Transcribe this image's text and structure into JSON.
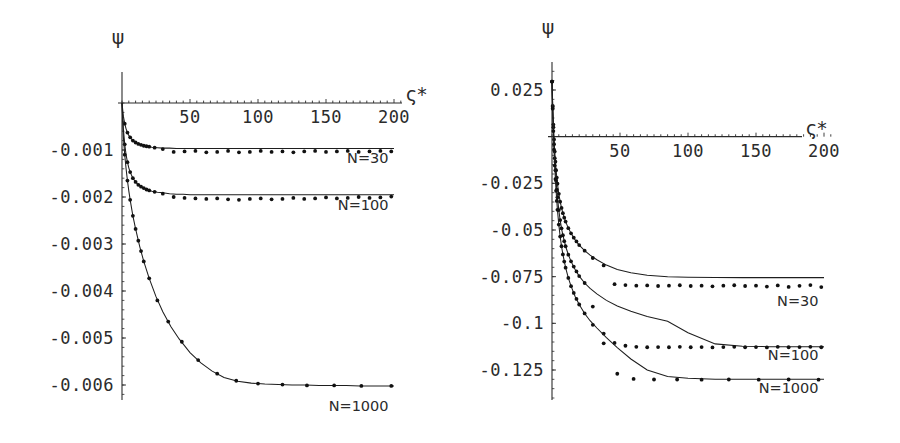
{
  "figure": {
    "background": "#ffffff",
    "ink_color": "#2b2b2b",
    "panels": [
      "left",
      "right"
    ]
  },
  "chart_data": [
    {
      "id": "left",
      "type": "line",
      "title": "",
      "subtitle": "",
      "xlabel": "ς*",
      "ylabel": "ψ",
      "xlim": [
        0,
        210
      ],
      "ylim": [
        -0.0063,
        0.0003
      ],
      "xticks": [
        50,
        100,
        150,
        200
      ],
      "xticklabels": [
        "50",
        "100",
        "150",
        "200"
      ],
      "yticks": [
        -0.001,
        -0.002,
        -0.003,
        -0.004,
        -0.005,
        -0.006
      ],
      "yticklabels": [
        "-0.001",
        "-0.002",
        "-0.003",
        "-0.004",
        "-0.005",
        "-0.006"
      ],
      "grid": false,
      "legend_position": "inline-right-of-curve",
      "axis_origin_crossing": [
        0,
        0
      ],
      "series": [
        {
          "name": "N=30",
          "label": "N=30",
          "label_xy": [
            196,
            -0.00128
          ],
          "marker": "dot",
          "plateau": -0.00097,
          "x": [
            0,
            1,
            2,
            3,
            4,
            5,
            6,
            8,
            10,
            12,
            15,
            18,
            22,
            26,
            30,
            35,
            40,
            45,
            50,
            57,
            64,
            71,
            78,
            85,
            92,
            100,
            108,
            116,
            124,
            132,
            140,
            148,
            156,
            164,
            172,
            180,
            188,
            196,
            200
          ],
          "y": [
            0.0,
            -0.00028,
            -0.00044,
            -0.00055,
            -0.00063,
            -0.00069,
            -0.00073,
            -0.0008,
            -0.00084,
            -0.00087,
            -0.0009,
            -0.00092,
            -0.00094,
            -0.00095,
            -0.00096,
            -0.00096,
            -0.00097,
            -0.00097,
            -0.00097,
            -0.00097,
            -0.00097,
            -0.00097,
            -0.00097,
            -0.00097,
            -0.00097,
            -0.00097,
            -0.00097,
            -0.00097,
            -0.00097,
            -0.00097,
            -0.00097,
            -0.00097,
            -0.00097,
            -0.00097,
            -0.00097,
            -0.00097,
            -0.00097,
            -0.00097,
            -0.00097
          ],
          "marker_x": [
            2,
            4,
            6,
            8,
            10,
            12,
            14,
            16,
            18,
            20,
            24,
            30,
            38,
            46,
            54,
            62,
            70,
            78,
            86,
            94,
            102,
            110,
            118,
            126,
            134,
            142,
            150,
            158,
            166,
            174,
            182,
            190,
            198
          ],
          "marker_y": [
            -0.00044,
            -0.00063,
            -0.00073,
            -0.0008,
            -0.00084,
            -0.00087,
            -0.00089,
            -0.00091,
            -0.00092,
            -0.00093,
            -0.00095,
            -0.00098,
            -0.00104,
            -0.00103,
            -0.00102,
            -0.00105,
            -0.00104,
            -0.00102,
            -0.00105,
            -0.00104,
            -0.00102,
            -0.00104,
            -0.00103,
            -0.00105,
            -0.00103,
            -0.00102,
            -0.00104,
            -0.00103,
            -0.00102,
            -0.00104,
            -0.00103,
            -0.00102,
            -0.00103
          ]
        },
        {
          "name": "N=100",
          "label": "N=100",
          "label_xy": [
            196,
            -0.00228
          ],
          "marker": "dot",
          "plateau": -0.00195,
          "x": [
            0,
            1,
            2,
            3,
            4,
            5,
            6,
            8,
            10,
            12,
            15,
            18,
            22,
            26,
            30,
            35,
            40,
            45,
            50,
            57,
            64,
            71,
            78,
            85,
            92,
            100,
            110,
            120,
            130,
            140,
            150,
            160,
            170,
            180,
            190,
            200
          ],
          "y": [
            0.0,
            -0.00055,
            -0.00088,
            -0.0011,
            -0.00126,
            -0.00138,
            -0.00147,
            -0.0016,
            -0.00168,
            -0.00174,
            -0.0018,
            -0.00184,
            -0.00188,
            -0.0019,
            -0.00191,
            -0.00193,
            -0.00194,
            -0.00194,
            -0.00195,
            -0.00195,
            -0.00195,
            -0.00195,
            -0.00195,
            -0.00195,
            -0.00195,
            -0.00195,
            -0.00195,
            -0.00195,
            -0.00195,
            -0.00195,
            -0.00195,
            -0.00195,
            -0.00195,
            -0.00195,
            -0.00195,
            -0.00195
          ],
          "marker_x": [
            2,
            4,
            6,
            8,
            10,
            12,
            14,
            16,
            18,
            20,
            24,
            30,
            38,
            46,
            54,
            62,
            70,
            78,
            86,
            94,
            102,
            110,
            118,
            126,
            134,
            142,
            150,
            158,
            166,
            174,
            182,
            190,
            198
          ],
          "marker_y": [
            -0.00088,
            -0.00126,
            -0.00147,
            -0.0016,
            -0.00168,
            -0.00174,
            -0.00178,
            -0.00181,
            -0.00184,
            -0.00186,
            -0.00189,
            -0.00193,
            -0.002,
            -0.00202,
            -0.00203,
            -0.00204,
            -0.00203,
            -0.00205,
            -0.00206,
            -0.00204,
            -0.00203,
            -0.00205,
            -0.00204,
            -0.00202,
            -0.00204,
            -0.00203,
            -0.00201,
            -0.00203,
            -0.00202,
            -0.002,
            -0.00202,
            -0.00201,
            -0.00199
          ]
        },
        {
          "name": "N=1000",
          "label": "N=1000",
          "label_xy": [
            196,
            -0.00655
          ],
          "marker": "dot",
          "plateau": -0.00602,
          "x": [
            0,
            1,
            2,
            3,
            4,
            5,
            6,
            8,
            10,
            13,
            16,
            20,
            25,
            30,
            36,
            42,
            50,
            58,
            66,
            75,
            85,
            95,
            105,
            115,
            125,
            135,
            145,
            155,
            165,
            175,
            185,
            195,
            200
          ],
          "y": [
            0.0,
            -0.00072,
            -0.0011,
            -0.0014,
            -0.00165,
            -0.00187,
            -0.00206,
            -0.0024,
            -0.00268,
            -0.00305,
            -0.00337,
            -0.00373,
            -0.00412,
            -0.00444,
            -0.00476,
            -0.00502,
            -0.00531,
            -0.00553,
            -0.0057,
            -0.00584,
            -0.00592,
            -0.00596,
            -0.00598,
            -0.00599,
            -0.006,
            -0.006,
            -0.00601,
            -0.00601,
            -0.00601,
            -0.00602,
            -0.00602,
            -0.00602,
            -0.00602
          ],
          "marker_x": [
            2,
            4,
            6,
            8,
            10,
            12,
            14,
            16,
            20,
            26,
            34,
            44,
            56,
            70,
            84,
            100,
            118,
            136,
            156,
            176,
            198
          ],
          "marker_y": [
            -0.0011,
            -0.00165,
            -0.00206,
            -0.0024,
            -0.00268,
            -0.00293,
            -0.00315,
            -0.00337,
            -0.00373,
            -0.0042,
            -0.00465,
            -0.00508,
            -0.00547,
            -0.00576,
            -0.00591,
            -0.00597,
            -0.00599,
            -0.00601,
            -0.00601,
            -0.00602,
            -0.00602
          ]
        }
      ]
    },
    {
      "id": "right",
      "type": "line",
      "title": "",
      "subtitle": "",
      "xlabel": "ς*",
      "ylabel": "ψ",
      "xlim": [
        0,
        210
      ],
      "ylim": [
        -0.138,
        0.031
      ],
      "xticks": [
        50,
        100,
        150,
        200
      ],
      "xticklabels": [
        "50",
        "100",
        "150",
        "200"
      ],
      "yticks": [
        0.025,
        -0.025,
        -0.05,
        -0.075,
        -0.1,
        -0.125
      ],
      "yticklabels": [
        "0.025",
        "-0.025",
        "-0.05",
        "-0.075",
        "-0.1",
        "-0.125"
      ],
      "grid": false,
      "legend_position": "inline-right-of-curve",
      "axis_origin_crossing": [
        0,
        0
      ],
      "series": [
        {
          "name": "N=30",
          "label": "N=30",
          "label_xy": [
            196,
            -0.0905
          ],
          "marker": "dot",
          "plateau": -0.0755,
          "x": [
            0,
            0.5,
            1,
            1.5,
            2,
            2.5,
            3,
            4,
            5,
            6,
            7,
            8,
            10,
            12,
            14,
            17,
            20,
            24,
            28,
            33,
            40,
            48,
            58,
            70,
            85,
            100,
            120,
            140,
            160,
            180,
            200
          ],
          "y": [
            0.0295,
            0.0165,
            0.0065,
            -0.0015,
            -0.008,
            -0.0134,
            -0.018,
            -0.0252,
            -0.0306,
            -0.0348,
            -0.0382,
            -0.041,
            -0.0455,
            -0.049,
            -0.0518,
            -0.0553,
            -0.0581,
            -0.0611,
            -0.0635,
            -0.0659,
            -0.0688,
            -0.0711,
            -0.0729,
            -0.0742,
            -0.075,
            -0.0753,
            -0.0755,
            -0.0755,
            -0.0755,
            -0.0755,
            -0.0755
          ],
          "marker_x": [
            0,
            0.5,
            1,
            1.5,
            2,
            2.5,
            3,
            3.5,
            4,
            5,
            6,
            7,
            8,
            9,
            10,
            12,
            14,
            16,
            18,
            20,
            24,
            30,
            38,
            46,
            54,
            62,
            70,
            78,
            86,
            94,
            102,
            110,
            118,
            126,
            134,
            142,
            150,
            158,
            166,
            174,
            182,
            190,
            198
          ],
          "marker_y": [
            0.0295,
            0.0165,
            0.0065,
            -0.0015,
            -0.008,
            -0.0134,
            -0.018,
            -0.0219,
            -0.0252,
            -0.0306,
            -0.0348,
            -0.0382,
            -0.041,
            -0.0434,
            -0.0455,
            -0.049,
            -0.0518,
            -0.0541,
            -0.0561,
            -0.0581,
            -0.0611,
            -0.065,
            -0.069,
            -0.079,
            -0.0795,
            -0.0798,
            -0.0797,
            -0.08,
            -0.0798,
            -0.0796,
            -0.08,
            -0.0798,
            -0.0802,
            -0.0798,
            -0.0796,
            -0.08,
            -0.0798,
            -0.0803,
            -0.0797,
            -0.0805,
            -0.0799,
            -0.0795,
            -0.0806
          ]
        },
        {
          "name": "N=100",
          "label": "N=100",
          "label_xy": [
            196,
            -0.1195
          ],
          "marker": "dot",
          "plateau": -0.1125,
          "x": [
            0,
            0.5,
            1,
            1.5,
            2,
            2.5,
            3,
            4,
            5,
            6,
            7,
            8,
            10,
            12,
            14,
            17,
            20,
            24,
            28,
            33,
            40,
            48,
            58,
            70,
            85,
            100,
            120,
            140,
            160,
            180,
            200
          ],
          "y": [
            0.0295,
            0.016,
            0.005,
            -0.004,
            -0.0115,
            -0.018,
            -0.0236,
            -0.0325,
            -0.0393,
            -0.0447,
            -0.0491,
            -0.0528,
            -0.0587,
            -0.0632,
            -0.0668,
            -0.0712,
            -0.0747,
            -0.0784,
            -0.0813,
            -0.0842,
            -0.0877,
            -0.0907,
            -0.0935,
            -0.0963,
            -0.0989,
            -0.105,
            -0.111,
            -0.1123,
            -0.1125,
            -0.1125,
            -0.1125
          ],
          "marker_x": [
            0,
            0.5,
            1,
            1.5,
            2,
            2.5,
            3,
            3.5,
            4,
            5,
            6,
            7,
            8,
            9,
            10,
            12,
            14,
            16,
            18,
            20,
            24,
            30,
            38,
            46,
            54,
            62,
            70,
            78,
            86,
            94,
            102,
            110,
            118,
            126,
            134,
            142,
            150,
            158,
            166,
            174,
            182,
            190,
            198
          ],
          "marker_y": [
            0.0295,
            0.016,
            0.005,
            -0.004,
            -0.0115,
            -0.018,
            -0.0236,
            -0.0284,
            -0.0325,
            -0.0393,
            -0.0447,
            -0.0491,
            -0.0528,
            -0.056,
            -0.0587,
            -0.0632,
            -0.0668,
            -0.0696,
            -0.0722,
            -0.0747,
            -0.0784,
            -0.091,
            -0.1055,
            -0.1105,
            -0.112,
            -0.1126,
            -0.1128,
            -0.1127,
            -0.1128,
            -0.1126,
            -0.1128,
            -0.1127,
            -0.1129,
            -0.1127,
            -0.1126,
            -0.1128,
            -0.1127,
            -0.1129,
            -0.1126,
            -0.1128,
            -0.1127,
            -0.1126,
            -0.1128
          ]
        },
        {
          "name": "N=1000",
          "label": "N=1000",
          "label_xy": [
            196,
            -0.1375
          ],
          "marker": "dot",
          "plateau": -0.13,
          "x": [
            0,
            0.5,
            1,
            1.5,
            2,
            2.5,
            3,
            4,
            5,
            6,
            7,
            8,
            10,
            12,
            14,
            17,
            20,
            24,
            28,
            33,
            40,
            48,
            58,
            70,
            85,
            100,
            120,
            140,
            160,
            180,
            200
          ],
          "y": [
            0.0295,
            0.015,
            0.003,
            -0.007,
            -0.0155,
            -0.0227,
            -0.029,
            -0.0392,
            -0.0471,
            -0.0535,
            -0.0587,
            -0.0631,
            -0.0702,
            -0.0757,
            -0.0801,
            -0.0856,
            -0.0899,
            -0.0947,
            -0.0986,
            -0.1025,
            -0.1077,
            -0.113,
            -0.1191,
            -0.125,
            -0.1285,
            -0.1294,
            -0.1299,
            -0.13,
            -0.13,
            -0.13,
            -0.13
          ],
          "marker_x": [
            0,
            0.5,
            1,
            1.5,
            2,
            2.5,
            3,
            3.5,
            4,
            5,
            6,
            7,
            8,
            9,
            10,
            12,
            14,
            16,
            18,
            20,
            24,
            30,
            38,
            48,
            60,
            75,
            92,
            110,
            130,
            152,
            174,
            196
          ],
          "marker_y": [
            0.0295,
            0.015,
            0.003,
            -0.007,
            -0.0155,
            -0.0227,
            -0.029,
            -0.0344,
            -0.0392,
            -0.0471,
            -0.0535,
            -0.0587,
            -0.0631,
            -0.0669,
            -0.0702,
            -0.0757,
            -0.0801,
            -0.0837,
            -0.0869,
            -0.0899,
            -0.0947,
            -0.1008,
            -0.1107,
            -0.127,
            -0.1298,
            -0.1301,
            -0.1301,
            -0.1302,
            -0.1301,
            -0.1302,
            -0.1301,
            -0.1302
          ]
        }
      ]
    }
  ]
}
